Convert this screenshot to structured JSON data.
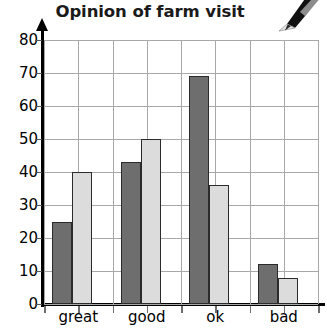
{
  "chart_data": {
    "type": "bar",
    "title": "Opinion of farm visit",
    "xlabel": "",
    "ylabel": "",
    "categories": [
      "great",
      "good",
      "ok",
      "bad"
    ],
    "series": [
      {
        "name": "series-1",
        "color": "#6e6e6e",
        "values": [
          25,
          43,
          69,
          12
        ]
      },
      {
        "name": "series-2",
        "color": "#dcdcdc",
        "values": [
          40,
          50,
          36,
          8
        ]
      }
    ],
    "ylim": [
      0,
      80
    ],
    "ytick_values": [
      0,
      10,
      20,
      30,
      40,
      50,
      60,
      70,
      80
    ],
    "ytick_labels": [
      "0",
      "10",
      "20",
      "30",
      "40",
      "50",
      "60",
      "70",
      "80"
    ],
    "grid": true,
    "grid_color": "#a8a8a8",
    "legend": "none",
    "axis_color": "#000000",
    "bar_outline_color": "#2b2b2b",
    "n_vertical_gridlines": 8
  },
  "decor": {
    "pencil_icon": "pencil-icon"
  }
}
